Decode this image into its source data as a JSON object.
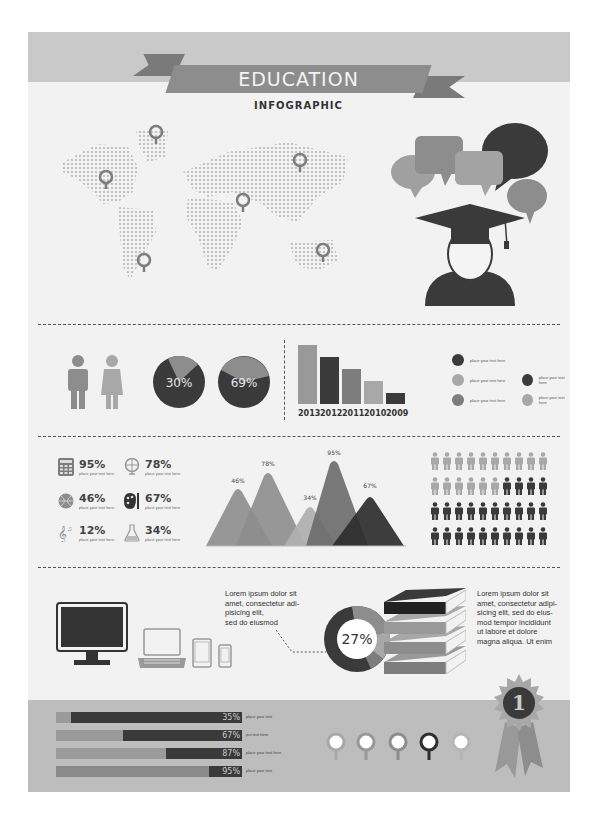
{
  "header": {
    "title": "EDUCATION",
    "subtitle": "INFOGRAPHIC"
  },
  "colors": {
    "dark": "#3a3a3a",
    "mid": "#7d7d7d",
    "light": "#a8a8a8",
    "pale": "#c9c9c9",
    "bg": "#f2f2f2"
  },
  "map": {
    "pins": 6
  },
  "gender_pies": [
    {
      "label": "30%",
      "value": 30
    },
    {
      "label": "69%",
      "value": 69
    }
  ],
  "chart_data": [
    {
      "type": "bar",
      "title": "",
      "categories": [
        "2013",
        "2012",
        "2011",
        "2010",
        "2009"
      ],
      "values": [
        100,
        80,
        60,
        40,
        18
      ],
      "xlabel": "",
      "ylabel": ""
    },
    {
      "type": "area",
      "title": "",
      "categories": [
        "A",
        "B",
        "C",
        "D",
        "E"
      ],
      "values": [
        46,
        78,
        34,
        95,
        67
      ],
      "labels": [
        "46%",
        "78%",
        "34%",
        "95%",
        "67%"
      ]
    },
    {
      "type": "pie",
      "title": "",
      "values": [
        27,
        73
      ],
      "center_label": "27%"
    }
  ],
  "legend": [
    {
      "text": "place your text here",
      "color": "#3a3a3a"
    },
    {
      "text": "place your text here",
      "color": "#a8a8a8"
    },
    {
      "text": "place your text here",
      "color": "#3a3a3a"
    },
    {
      "text": "place your text here",
      "color": "#7d7d7d"
    },
    {
      "text": "place your text here",
      "color": "#a8a8a8"
    }
  ],
  "stats": [
    {
      "icon": "calculator-icon",
      "value": "95%",
      "sub": "place your text here"
    },
    {
      "icon": "globe-icon",
      "value": "78%",
      "sub": "place your text here"
    },
    {
      "icon": "basketball-icon",
      "value": "46%",
      "sub": "place your text here"
    },
    {
      "icon": "palette-icon",
      "value": "67%",
      "sub": "place your text here"
    },
    {
      "icon": "music-note-icon",
      "value": "12%",
      "sub": "place your text here"
    },
    {
      "icon": "flask-icon",
      "value": "34%",
      "sub": "place your text here"
    }
  ],
  "mountains": {
    "labels": [
      "46%",
      "78%",
      "34%",
      "95%",
      "67%"
    ]
  },
  "people_grid": {
    "rows": 4,
    "cols": 10,
    "light": 16,
    "dark": 24
  },
  "devices_text": "Lorem ipsum dolor sit amet, consectetur adi-piisicing elit, sed do eiusmod",
  "donut": {
    "label": "27%"
  },
  "books_text": "Lorem ipsum dolor sit amet, consectetur adipi-sicing elit, sed do eius-mod tempor incididunt ut labore et dolore magna aliqua. Ut enim",
  "devices_lines": [
    "Lorem ipsum dolor sit",
    "amet, consectetur adi-",
    "pisicing elit,",
    "sed do eiusmod"
  ],
  "books_lines": [
    "Lorem ipsum dolor sit",
    "amet, consectetur adipi-",
    "sicing elit, sed do eius-",
    "mod tempor incididunt",
    "ut labore et dolore",
    "magna aliqua. Ut enim"
  ],
  "hbars": [
    {
      "pct": "35%",
      "value": 35,
      "light": 12,
      "text": "place your text"
    },
    {
      "pct": "67%",
      "value": 67,
      "light": 39,
      "text": "put text here"
    },
    {
      "pct": "87%",
      "value": 87,
      "light": 61,
      "text": "place your text here"
    },
    {
      "pct": "95%",
      "value": 95,
      "light": 84,
      "text": "place your text"
    }
  ],
  "pins_row": 5,
  "badge": {
    "label": "1"
  }
}
